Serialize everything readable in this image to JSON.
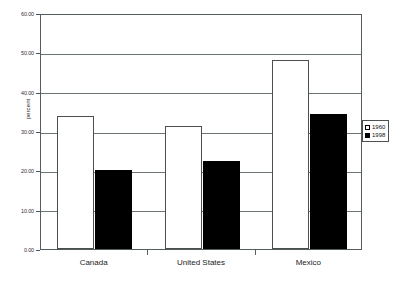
{
  "chart_data": {
    "type": "bar",
    "title": "",
    "subtitle": "",
    "xlabel": "",
    "ylabel": "percent",
    "categories": [
      "Canada",
      "United States",
      "Mexico"
    ],
    "series": [
      {
        "name": "1960",
        "values": [
          33.8,
          31.2,
          48.0
        ],
        "color": "#ffffff"
      },
      {
        "name": "1998",
        "values": [
          20.0,
          22.4,
          34.4
        ],
        "color": "#000000"
      }
    ],
    "ylim": [
      0,
      60
    ],
    "yticks": [
      0,
      10,
      20,
      30,
      40,
      50,
      60
    ],
    "ytick_labels": [
      "0.00",
      "10.00",
      "20.00",
      "30.00",
      "40.00",
      "50.00",
      "60.00"
    ],
    "grid": "horizontal",
    "legend_position": "right",
    "annotations": []
  },
  "legend": {
    "entries": [
      {
        "label": "1960",
        "swatch": "hollow-square"
      },
      {
        "label": "1998",
        "swatch": "filled-square"
      }
    ]
  }
}
